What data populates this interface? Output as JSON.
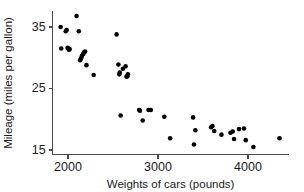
{
  "chart_data": {
    "type": "scatter",
    "title": "",
    "xlabel": "Weights of cars (pounds)",
    "ylabel": "Mileage (miles per gallon)",
    "xlim": [
      1830,
      4450
    ],
    "ylim": [
      14.2,
      37.6
    ],
    "xticks": [
      2000,
      3000,
      4000
    ],
    "xticklabels": [
      "2000",
      "3000",
      "4000"
    ],
    "yticks": [
      15,
      25,
      35
    ],
    "yticklabels": [
      "15",
      "25",
      "35"
    ],
    "grid": false,
    "legend": null,
    "marker": "filled-circle",
    "marker_color": "#000000",
    "series": [
      {
        "name": "cars",
        "x": [
          1918,
          1925,
          1975,
          1985,
          1995,
          2005,
          2010,
          2018,
          2095,
          2120,
          2135,
          2145,
          2155,
          2170,
          2180,
          2190,
          2205,
          2285,
          2540,
          2560,
          2570,
          2575,
          2585,
          2610,
          2640,
          2650,
          2660,
          2665,
          2790,
          2800,
          2830,
          2895,
          2920,
          3070,
          3135,
          3390,
          3400,
          3415,
          3590,
          3605,
          3625,
          3705,
          3805,
          3830,
          3845,
          3900,
          3955,
          3975,
          4060,
          4350
        ],
        "y": [
          35.0,
          31.5,
          34.3,
          34.5,
          31.6,
          31.5,
          31.3,
          31.4,
          36.8,
          34.3,
          29.6,
          29.9,
          30.3,
          30.6,
          30.9,
          31.0,
          28.8,
          27.2,
          33.8,
          28.9,
          27.3,
          27.6,
          20.6,
          28.2,
          28.6,
          26.9,
          27.0,
          27.3,
          21.5,
          21.4,
          19.8,
          21.5,
          21.5,
          20.4,
          16.9,
          20.3,
          15.9,
          18.2,
          18.7,
          18.9,
          18.1,
          17.5,
          17.8,
          18.0,
          16.8,
          18.4,
          18.5,
          16.6,
          15.5,
          16.9
        ]
      }
    ]
  }
}
